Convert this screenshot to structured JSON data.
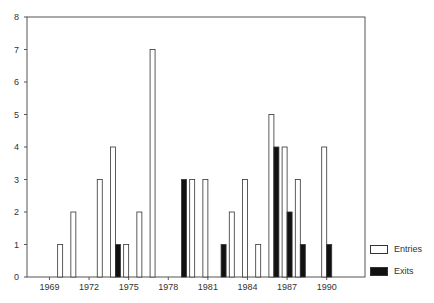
{
  "chart_data": {
    "type": "bar",
    "title": "",
    "xlabel": "",
    "ylabel": "",
    "ylim": [
      0,
      8
    ],
    "yticks": [
      0,
      1,
      2,
      3,
      4,
      5,
      6,
      7,
      8
    ],
    "xticks": [
      1969,
      1972,
      1975,
      1978,
      1981,
      1984,
      1987,
      1990
    ],
    "xlim": [
      1967.3,
      1992.9
    ],
    "grid": false,
    "legend_position": "right-bottom",
    "categories": [
      1969,
      1970,
      1971,
      1972,
      1973,
      1974,
      1975,
      1976,
      1977,
      1978,
      1979,
      1980,
      1981,
      1982,
      1983,
      1984,
      1985,
      1986,
      1987,
      1988,
      1989,
      1990
    ],
    "series": [
      {
        "name": "Entries",
        "color": "#ffffff",
        "values": [
          0,
          1,
          2,
          0,
          3,
          4,
          1,
          2,
          7,
          0,
          0,
          3,
          3,
          0,
          2,
          3,
          1,
          5,
          4,
          3,
          0,
          4
        ]
      },
      {
        "name": "Exits",
        "color": "#111111",
        "values": [
          0,
          0,
          0,
          0,
          0,
          1,
          0,
          0,
          0,
          0,
          3,
          0,
          0,
          1,
          0,
          0,
          0,
          4,
          2,
          1,
          0,
          1
        ]
      }
    ]
  },
  "legend": {
    "entries_label": "Entries",
    "exits_label": "Exits"
  }
}
